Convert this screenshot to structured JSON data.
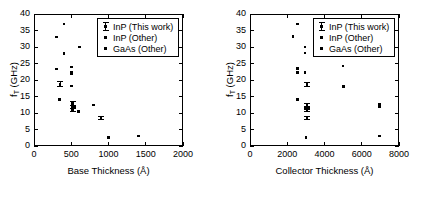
{
  "figure": {
    "background": "#ffffff",
    "foreground": "#000000"
  },
  "legend": {
    "position": "upper-right",
    "entries": [
      {
        "label": "InP (This work)",
        "marker": "errorbar-icon"
      },
      {
        "label": "InP (Other)",
        "marker": "filled-circle-medium-icon"
      },
      {
        "label": "GaAs (Other)",
        "marker": "filled-circle-small-icon"
      }
    ]
  },
  "chart_data": [
    {
      "type": "scatter",
      "panel": "left",
      "title": "",
      "xlabel": "Base Thickness (Å)",
      "ylabel": "f_T (GHz)",
      "ylabel_main": "f",
      "ylabel_sub": "T",
      "ylabel_unit": " (GHz)",
      "xlim": [
        0,
        2000
      ],
      "ylim": [
        0,
        40
      ],
      "xticks": [
        0,
        500,
        1000,
        1500,
        2000
      ],
      "xticklabels": [
        "0",
        "500",
        "1000",
        "1500",
        "2000"
      ],
      "yticks": [
        0,
        5,
        10,
        15,
        20,
        25,
        30,
        35,
        40
      ],
      "yticklabels": [
        "0",
        "5",
        "10",
        "15",
        "20",
        "25",
        "30",
        "35",
        "40"
      ],
      "grid": false,
      "tick_direction": "in",
      "series": [
        {
          "name": "InP (This work)",
          "marker": "errorbar",
          "points": [
            {
              "x": 350,
              "y": 18.7,
              "yerr": 0.9
            },
            {
              "x": 520,
              "y": 12.8,
              "yerr": 0.7
            },
            {
              "x": 520,
              "y": 11.8,
              "yerr": 0.6
            },
            {
              "x": 520,
              "y": 11.0,
              "yerr": 0.5
            },
            {
              "x": 900,
              "y": 8.5,
              "yerr": 0.6
            }
          ]
        },
        {
          "name": "InP (Other)",
          "marker": "dot-medium",
          "points": [
            {
              "x": 345,
              "y": 14.0
            },
            {
              "x": 540,
              "y": 11.6
            },
            {
              "x": 600,
              "y": 10.5
            }
          ]
        },
        {
          "name": "GaAs (Other)",
          "marker": "dot-small",
          "points": [
            {
              "x": 300,
              "y": 33.0
            },
            {
              "x": 300,
              "y": 23.3
            },
            {
              "x": 400,
              "y": 37.0
            },
            {
              "x": 400,
              "y": 28.0
            },
            {
              "x": 500,
              "y": 24.0
            },
            {
              "x": 500,
              "y": 22.2
            },
            {
              "x": 500,
              "y": 21.8
            },
            {
              "x": 500,
              "y": 18.2
            },
            {
              "x": 610,
              "y": 30.0
            },
            {
              "x": 800,
              "y": 12.4
            },
            {
              "x": 1000,
              "y": 2.5
            },
            {
              "x": 1400,
              "y": 3.0
            }
          ]
        }
      ]
    },
    {
      "type": "scatter",
      "panel": "right",
      "title": "",
      "xlabel": "Collector Thickness (Å)",
      "ylabel": "f_T (GHz)",
      "ylabel_main": "f",
      "ylabel_sub": "T",
      "ylabel_unit": " (GHz)",
      "xlim": [
        0,
        8000
      ],
      "ylim": [
        0,
        40
      ],
      "xticks": [
        0,
        2000,
        4000,
        6000,
        8000
      ],
      "xticklabels": [
        "0",
        "2000",
        "4000",
        "6000",
        "8000"
      ],
      "yticks": [
        0,
        5,
        10,
        15,
        20,
        25,
        30,
        35,
        40
      ],
      "yticklabels": [
        "0",
        "5",
        "10",
        "15",
        "20",
        "25",
        "30",
        "35",
        "40"
      ],
      "grid": false,
      "tick_direction": "in",
      "series": [
        {
          "name": "InP (This work)",
          "marker": "errorbar",
          "points": [
            {
              "x": 3050,
              "y": 18.6,
              "yerr": 0.8
            },
            {
              "x": 3050,
              "y": 12.3,
              "yerr": 0.7
            },
            {
              "x": 3050,
              "y": 11.6,
              "yerr": 0.6
            },
            {
              "x": 3050,
              "y": 10.9,
              "yerr": 0.6
            },
            {
              "x": 3050,
              "y": 8.5,
              "yerr": 0.7
            }
          ]
        },
        {
          "name": "InP (Other)",
          "marker": "dot-medium",
          "points": [
            {
              "x": 2550,
              "y": 14.0
            },
            {
              "x": 5000,
              "y": 18.0
            },
            {
              "x": 6950,
              "y": 12.5
            },
            {
              "x": 6950,
              "y": 12.0
            }
          ]
        },
        {
          "name": "GaAs (Other)",
          "marker": "dot-small",
          "points": [
            {
              "x": 2300,
              "y": 33.2
            },
            {
              "x": 2550,
              "y": 37.0
            },
            {
              "x": 2550,
              "y": 23.5
            },
            {
              "x": 2550,
              "y": 22.3
            },
            {
              "x": 2950,
              "y": 30.0
            },
            {
              "x": 2950,
              "y": 28.2
            },
            {
              "x": 2950,
              "y": 22.2
            },
            {
              "x": 3000,
              "y": 2.5
            },
            {
              "x": 5000,
              "y": 24.2
            },
            {
              "x": 6950,
              "y": 3.0
            }
          ]
        }
      ]
    }
  ]
}
